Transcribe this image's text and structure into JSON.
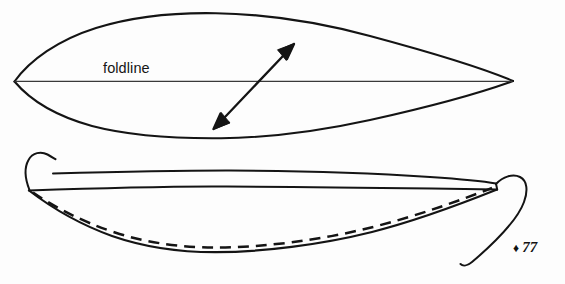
{
  "page": {
    "background_color": "#fdfdfd",
    "ink_color": "#111111",
    "width": 565,
    "height": 284
  },
  "diagram": {
    "title": "foldline",
    "type": "sewing-pattern-illustration",
    "labels": {
      "foldline": "foldline"
    },
    "upper_figure": {
      "name": "lens-shaped-pattern-piece",
      "description": "pointed oval pattern piece with horizontal foldline and double-headed grain arrow",
      "left_tip": [
        14,
        81
      ],
      "right_tip": [
        513,
        81
      ],
      "top_apex": [
        215,
        13
      ],
      "bottom_apex": [
        219,
        138
      ],
      "foldline_y": 81,
      "grain_arrow": {
        "from": [
          214,
          128
        ],
        "to": [
          294,
          44
        ],
        "double_headed": true
      }
    },
    "lower_figure": {
      "name": "stitched-folded-piece",
      "description": "folded piece shown edge-on with dashed stitch line and thread tails at both ends",
      "left_end": [
        29,
        190
      ],
      "right_end": [
        497,
        186
      ],
      "bottom_point": [
        215,
        252
      ],
      "stitch_line_style": "dashed",
      "thread_tails": [
        "left-hook-tail",
        "right-loop-tail"
      ]
    }
  },
  "folio": {
    "marker_glyph": "♦",
    "page_number": "77"
  }
}
